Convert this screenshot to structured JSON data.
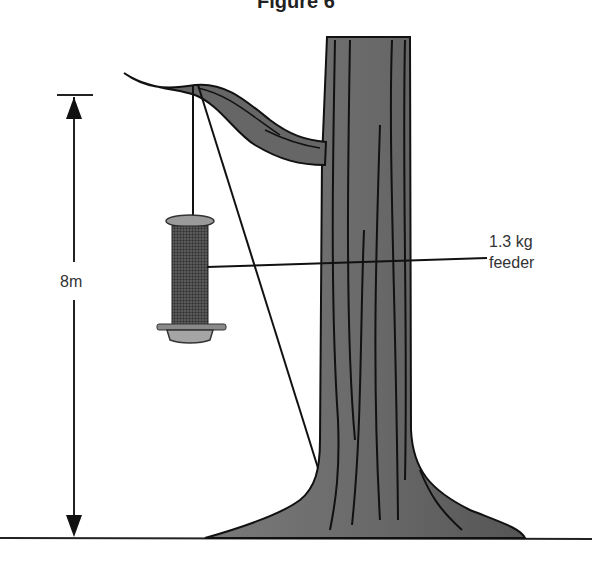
{
  "figure": {
    "title": "Figure 6",
    "height_label": "8m",
    "feeder_label_line1": "1.3 kg",
    "feeder_label_line2": "feeder"
  },
  "colors": {
    "trunk": "#6e6e6e",
    "outline": "#111111",
    "feeder_cap": "#9a9a9a",
    "mesh": "#3c3c3c"
  }
}
